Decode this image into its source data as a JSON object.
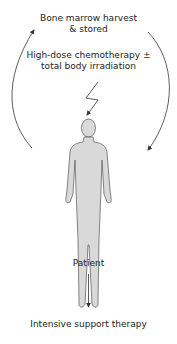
{
  "diagram": {
    "top_label_line1": "Bone marrow harvest",
    "top_label_line2": "& stored",
    "treatment_line1": "High-dose chemotherapy ±",
    "treatment_line2": "total body irradiation",
    "patient_label": "Patient",
    "bottom_label": "Intensive support therapy",
    "colors": {
      "figure_fill": "#d9d9d9",
      "figure_stroke": "#555555",
      "arrow": "#333333",
      "text": "#222222"
    },
    "icons": [
      "lightning-bolt-icon",
      "human-figure-icon",
      "arrow-icon"
    ]
  }
}
